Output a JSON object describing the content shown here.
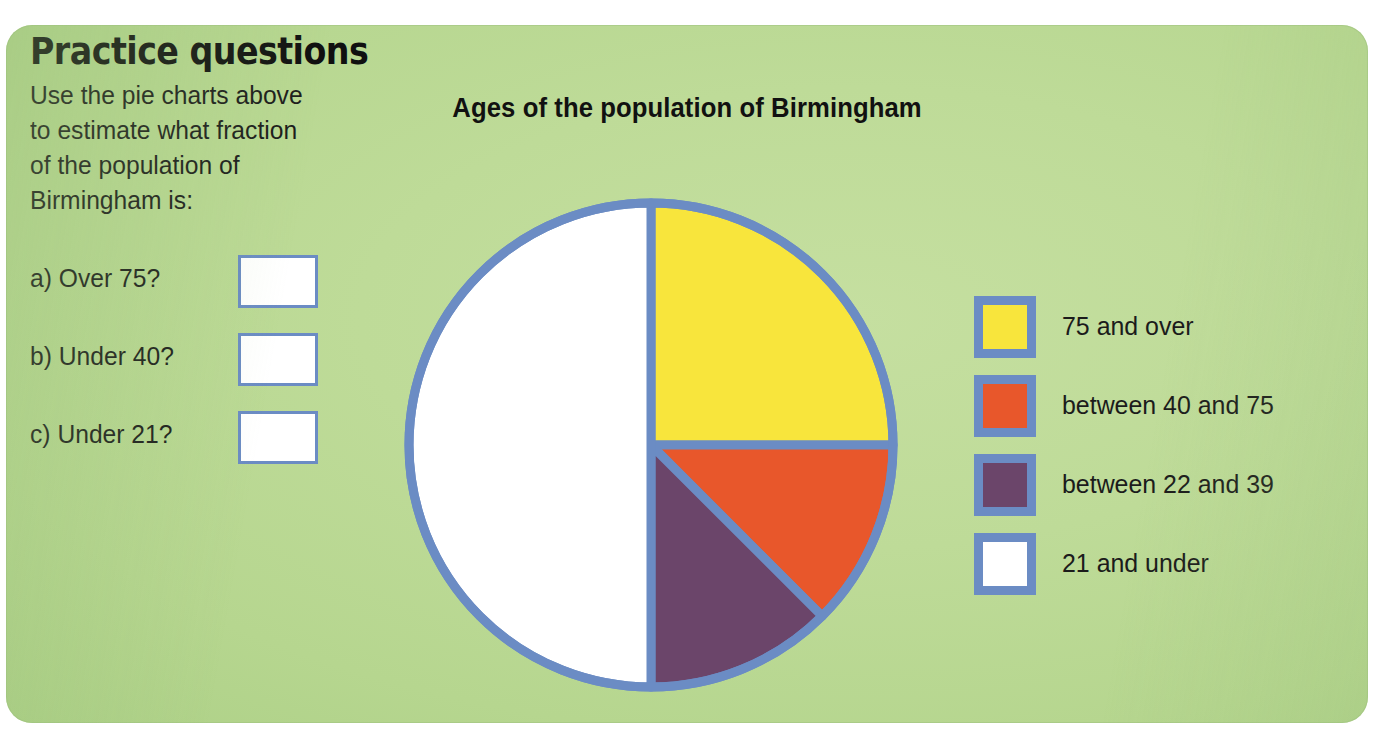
{
  "panel": {
    "background_color": "#b8d792",
    "border_color": "#6b8cc4"
  },
  "heading": "Practice questions",
  "intro": "Use the pie charts above to estimate what fraction of the population of Birmingham is:",
  "questions": [
    {
      "label": "a) Over 75?",
      "answer": ""
    },
    {
      "label": "b) Under 40?",
      "answer": ""
    },
    {
      "label": "c) Under 21?",
      "answer": ""
    }
  ],
  "chart_data": {
    "type": "pie",
    "title": "Ages of the population of Birmingham",
    "xlabel": "",
    "ylabel": "",
    "legend_position": "right",
    "start_angle_deg": 0,
    "direction": "clockwise",
    "categories": [
      "75 and over",
      "between 40 and 75",
      "between 22 and 39",
      "21 and under"
    ],
    "values": [
      25,
      12.5,
      12.5,
      50
    ],
    "value_unit": "percent",
    "colors": [
      "#f8e53c",
      "#e8572b",
      "#6b456a",
      "#ffffff"
    ],
    "slice_stroke_color": "#6b8cc4",
    "annotations": []
  },
  "legend": {
    "items": [
      {
        "label": "75 and over",
        "color": "#f8e53c"
      },
      {
        "label": "between 40 and 75",
        "color": "#e8572b"
      },
      {
        "label": "between 22 and 39",
        "color": "#6b456a"
      },
      {
        "label": "21 and under",
        "color": "#ffffff"
      }
    ]
  }
}
